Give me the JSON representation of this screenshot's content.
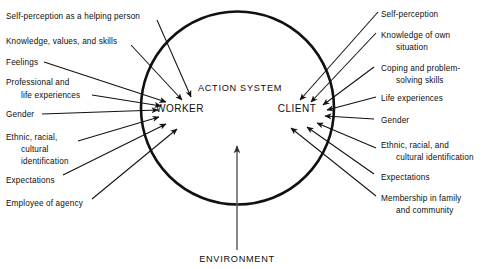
{
  "figure": {
    "center_label": "ACTION SYSTEM",
    "environment_label": "ENVIRONMENT",
    "worker_label": "WORKER",
    "client_label": "CLIENT",
    "colors": {
      "background": "#ffffff",
      "ink": "#111111",
      "environment_arrow": "#555555"
    }
  },
  "worker_factors": [
    {
      "lines": [
        "Self-perception as a helping person"
      ]
    },
    {
      "lines": [
        "Knowledge, values, and skills"
      ]
    },
    {
      "lines": [
        "Feelings"
      ]
    },
    {
      "lines": [
        "Professional and",
        "life experiences"
      ]
    },
    {
      "lines": [
        "Gender"
      ]
    },
    {
      "lines": [
        "Ethnic, racial,",
        "cultural",
        "identification"
      ]
    },
    {
      "lines": [
        "Expectations"
      ]
    },
    {
      "lines": [
        "Employee of agency"
      ]
    }
  ],
  "client_factors": [
    {
      "lines": [
        "Self-perception"
      ]
    },
    {
      "lines": [
        "Knowledge of own",
        "situation"
      ]
    },
    {
      "lines": [
        "Coping and problem-",
        "solving skills"
      ]
    },
    {
      "lines": [
        "Life experiences"
      ]
    },
    {
      "lines": [
        "Gender"
      ]
    },
    {
      "lines": [
        "Ethnic, racial, and",
        "cultural identification"
      ]
    },
    {
      "lines": [
        "Expectations"
      ]
    },
    {
      "lines": [
        "Membership in family",
        "and community"
      ]
    }
  ]
}
